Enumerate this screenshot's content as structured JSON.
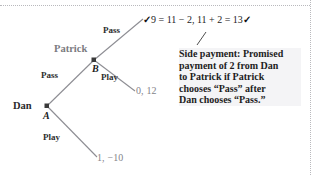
{
  "diagram": {
    "players": [
      {
        "id": "dan",
        "label": "Dan"
      },
      {
        "id": "patrick",
        "label": "Patrick"
      }
    ],
    "nodes": [
      {
        "id": "A",
        "label": "A",
        "owner": "Dan"
      },
      {
        "id": "B",
        "label": "B",
        "owner": "Patrick"
      }
    ],
    "actions": {
      "dan_pass": "Pass",
      "dan_play": "Play",
      "patrick_pass": "Pass",
      "patrick_play": "Play"
    },
    "payoffs": {
      "pass_pass": {
        "dan": "9",
        "sep": ",",
        "patrick": "13",
        "display": "9 = 11 − 2 , 11 + 2 = 13"
      },
      "pass_play": {
        "dan": "0",
        "sep": ",",
        "patrick": "12"
      },
      "play": {
        "dan": "1",
        "sep": ",",
        "patrick": "−10"
      }
    },
    "equation": {
      "check_left": "✓",
      "dan_expr": "9 = 11 − 2",
      "separator": ",",
      "patrick_expr": "11 + 2 = 13",
      "check_right": "✓"
    },
    "annotation": {
      "lines": [
        "Side payment: Promised",
        "payment of 2 from Dan",
        "to Patrick if Patrick",
        "chooses “Pass” after",
        "Dan chooses “Pass.”"
      ]
    },
    "colors": {
      "branch": "#8d8d93",
      "player_gray": "#7b7b80",
      "payoff_gray": "#84848a",
      "text_dark": "#1d1d1d",
      "annotation_bg": "#f4f4f6",
      "page_guide": "#b9b9bd"
    }
  }
}
